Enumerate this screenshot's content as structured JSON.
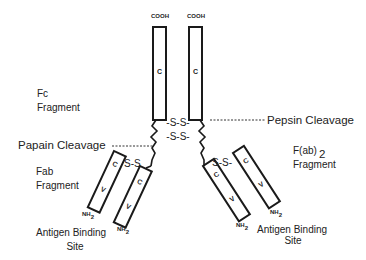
{
  "diagram": {
    "terminals": {
      "cooh_left": "COOH",
      "cooh_right": "COOH",
      "nh2_main": "NH",
      "nh2_sub": "2"
    },
    "domains": {
      "constant": "C",
      "variable": "V"
    },
    "disulfide": {
      "hinge_1": "-S-S-",
      "hinge_2": "-S-S-",
      "arm_left": "S-S",
      "arm_right": "S-S-"
    },
    "labels": {
      "fc_line1": "Fc",
      "fc_line2": "Fragment",
      "pepsin": "Pepsin Cleavage",
      "papain": "Papain Cleavage",
      "fab_line1": "Fab",
      "fab_line2": "Fragment",
      "fab2_main": "F(ab)",
      "fab2_sub": "2",
      "fab2_line2": "Fragment",
      "antigen_left_line1": "Antigen Binding",
      "antigen_left_line2": "Site",
      "antigen_right_line1": "Antigen Binding",
      "antigen_right_line2": "Site"
    }
  }
}
